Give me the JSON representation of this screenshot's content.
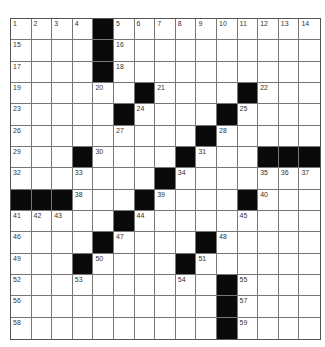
{
  "puzzle": {
    "rows": 15,
    "cols": 15,
    "colors": {
      "black": "#0a0a0a",
      "white": "#ffffff",
      "line": "#777777"
    },
    "black_squares": [
      [
        0,
        4
      ],
      [
        1,
        4
      ],
      [
        2,
        4
      ],
      [
        3,
        6
      ],
      [
        3,
        11
      ],
      [
        4,
        5
      ],
      [
        4,
        10
      ],
      [
        5,
        9
      ],
      [
        6,
        3
      ],
      [
        6,
        8
      ],
      [
        6,
        12
      ],
      [
        6,
        13
      ],
      [
        6,
        14
      ],
      [
        7,
        7
      ],
      [
        8,
        0
      ],
      [
        8,
        1
      ],
      [
        8,
        2
      ],
      [
        8,
        6
      ],
      [
        8,
        11
      ],
      [
        9,
        5
      ],
      [
        10,
        4
      ],
      [
        10,
        9
      ],
      [
        11,
        3
      ],
      [
        11,
        8
      ],
      [
        12,
        10
      ],
      [
        13,
        10
      ],
      [
        14,
        10
      ]
    ],
    "numbers": [
      {
        "r": 0,
        "c": 0,
        "n": "1"
      },
      {
        "r": 0,
        "c": 1,
        "n": "2"
      },
      {
        "r": 0,
        "c": 2,
        "n": "3"
      },
      {
        "r": 0,
        "c": 3,
        "n": "4"
      },
      {
        "r": 0,
        "c": 5,
        "n": "5"
      },
      {
        "r": 0,
        "c": 6,
        "n": "6"
      },
      {
        "r": 0,
        "c": 7,
        "n": "7"
      },
      {
        "r": 0,
        "c": 8,
        "n": "8"
      },
      {
        "r": 0,
        "c": 9,
        "n": "9"
      },
      {
        "r": 0,
        "c": 10,
        "n": "10"
      },
      {
        "r": 0,
        "c": 11,
        "n": "11"
      },
      {
        "r": 0,
        "c": 12,
        "n": "12"
      },
      {
        "r": 0,
        "c": 13,
        "n": "13"
      },
      {
        "r": 0,
        "c": 14,
        "n": "14"
      },
      {
        "r": 1,
        "c": 0,
        "n": "15"
      },
      {
        "r": 1,
        "c": 5,
        "n": "16"
      },
      {
        "r": 2,
        "c": 0,
        "n": "17"
      },
      {
        "r": 2,
        "c": 5,
        "n": "18"
      },
      {
        "r": 3,
        "c": 0,
        "n": "19"
      },
      {
        "r": 3,
        "c": 4,
        "n": "20"
      },
      {
        "r": 3,
        "c": 7,
        "n": "21"
      },
      {
        "r": 3,
        "c": 12,
        "n": "22"
      },
      {
        "r": 4,
        "c": 0,
        "n": "23"
      },
      {
        "r": 4,
        "c": 6,
        "n": "24"
      },
      {
        "r": 4,
        "c": 11,
        "n": "25"
      },
      {
        "r": 5,
        "c": 0,
        "n": "26"
      },
      {
        "r": 5,
        "c": 5,
        "n": "27"
      },
      {
        "r": 5,
        "c": 10,
        "n": "28"
      },
      {
        "r": 6,
        "c": 0,
        "n": "29"
      },
      {
        "r": 6,
        "c": 4,
        "n": "30"
      },
      {
        "r": 6,
        "c": 9,
        "n": "31"
      },
      {
        "r": 7,
        "c": 0,
        "n": "32"
      },
      {
        "r": 7,
        "c": 3,
        "n": "33"
      },
      {
        "r": 7,
        "c": 8,
        "n": "34"
      },
      {
        "r": 7,
        "c": 12,
        "n": "35"
      },
      {
        "r": 7,
        "c": 13,
        "n": "36"
      },
      {
        "r": 7,
        "c": 14,
        "n": "37"
      },
      {
        "r": 8,
        "c": 3,
        "n": "38"
      },
      {
        "r": 8,
        "c": 7,
        "n": "39"
      },
      {
        "r": 8,
        "c": 12,
        "n": "40"
      },
      {
        "r": 9,
        "c": 0,
        "n": "41"
      },
      {
        "r": 9,
        "c": 1,
        "n": "42"
      },
      {
        "r": 9,
        "c": 2,
        "n": "43"
      },
      {
        "r": 9,
        "c": 6,
        "n": "44"
      },
      {
        "r": 9,
        "c": 11,
        "n": "45"
      },
      {
        "r": 10,
        "c": 0,
        "n": "46"
      },
      {
        "r": 10,
        "c": 5,
        "n": "47"
      },
      {
        "r": 10,
        "c": 10,
        "n": "48"
      },
      {
        "r": 11,
        "c": 0,
        "n": "49"
      },
      {
        "r": 11,
        "c": 4,
        "n": "50"
      },
      {
        "r": 11,
        "c": 9,
        "n": "51"
      },
      {
        "r": 12,
        "c": 0,
        "n": "52"
      },
      {
        "r": 12,
        "c": 3,
        "n": "53"
      },
      {
        "r": 12,
        "c": 8,
        "n": "54"
      },
      {
        "r": 12,
        "c": 11,
        "n": "55"
      },
      {
        "r": 13,
        "c": 0,
        "n": "56"
      },
      {
        "r": 13,
        "c": 11,
        "n": "57"
      },
      {
        "r": 14,
        "c": 0,
        "n": "58"
      },
      {
        "r": 14,
        "c": 11,
        "n": "59"
      }
    ]
  }
}
